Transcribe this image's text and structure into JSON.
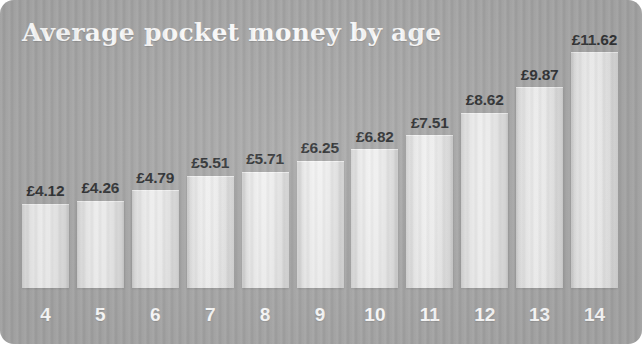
{
  "chart_data": {
    "type": "bar",
    "title": "Average pocket money by age",
    "xlabel": "",
    "ylabel": "",
    "currency": "£",
    "categories": [
      "4",
      "5",
      "6",
      "7",
      "8",
      "9",
      "10",
      "11",
      "12",
      "13",
      "14"
    ],
    "values": [
      4.12,
      4.26,
      4.79,
      5.51,
      5.71,
      6.25,
      6.82,
      7.51,
      8.62,
      9.87,
      11.62
    ],
    "value_labels": [
      "£4.12",
      "£4.26",
      "£4.79",
      "£5.51",
      "£5.71",
      "£6.25",
      "£6.82",
      "£7.51",
      "£8.62",
      "£9.87",
      "£11.62"
    ],
    "ylim": [
      0,
      11.62
    ],
    "grid": false,
    "legend": null,
    "colors": {
      "background": "#a8a8a8",
      "bar": "#f0f0f0",
      "title_text": "#ffffff",
      "value_text": "#2f3133",
      "axis_text": "#ffffff"
    }
  }
}
